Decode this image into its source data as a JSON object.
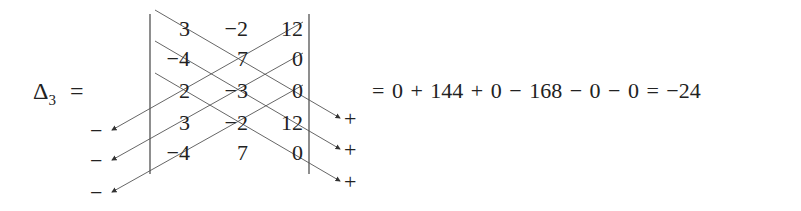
{
  "lhs": {
    "symbol": "Δ",
    "subscript": "3",
    "equals": "="
  },
  "matrix": {
    "rows": [
      [
        "3",
        "−2",
        "12"
      ],
      [
        "−4",
        "7",
        "0"
      ],
      [
        "2",
        "−3",
        "0"
      ],
      [
        "3",
        "−2",
        "12"
      ],
      [
        "−4",
        "7",
        "0"
      ]
    ]
  },
  "signs": {
    "left": [
      "−",
      "−",
      "−"
    ],
    "right": [
      "+",
      "+",
      "+"
    ]
  },
  "rhs": {
    "expression": "= 0 + 144 + 0 − 168 − 0 − 0 = −24"
  },
  "colors": {
    "text": "#222222",
    "lines": "#555555"
  }
}
